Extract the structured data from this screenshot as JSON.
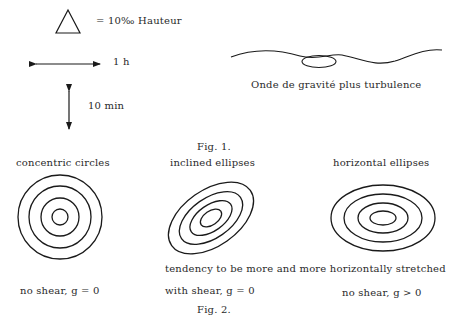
{
  "fig1": {
    "legend": {
      "triangle_label": "= 10‰ Hauteur",
      "horizontal_arrow_label": "1 h",
      "vertical_arrow_label": "10 min"
    },
    "wave_caption": "Onde de gravité plus turbulence",
    "caption": "Fig. 1."
  },
  "fig2": {
    "panels": [
      {
        "title": "concentric circles",
        "condition": "no shear,  g = 0"
      },
      {
        "title": "inclined ellipses",
        "condition": "with shear,  g = 0"
      },
      {
        "title": "horizontal ellipses",
        "condition": "no shear,  g > 0"
      }
    ],
    "tendency_note": "tendency to be more and more horizontally stretched",
    "caption": "Fig. 2."
  },
  "colors": {
    "ink": "#2a2a2a",
    "background": "#ffffff"
  }
}
